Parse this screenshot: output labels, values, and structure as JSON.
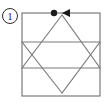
{
  "figure": {
    "label": "1",
    "label_style": "circled-number",
    "colors": {
      "frame_stroke": "#6e6e6e",
      "star_stroke": "#7a7a7a",
      "marker_fill": "#1a1a1a",
      "arrow_fill": "#1a1a1a",
      "label_stroke": "#2b2b2b",
      "background": "#ffffff"
    },
    "label_circle": {
      "cx": 10,
      "cy": 16,
      "r": 7.5
    },
    "frame": {
      "x": 22,
      "y": 13,
      "width": 78,
      "height": 83
    },
    "up_triangle": {
      "apex": [
        62,
        15
      ],
      "left": [
        22,
        68
      ],
      "right": [
        100,
        68
      ]
    },
    "down_triangle": {
      "apex": [
        62,
        93
      ],
      "left": [
        22,
        42
      ],
      "right": [
        100,
        42
      ]
    },
    "marker_dot": {
      "cx": 54,
      "cy": 13,
      "r": 3.2
    },
    "arrow_head": {
      "tip": [
        62,
        13
      ],
      "back_top": [
        70,
        9
      ],
      "back_bottom": [
        70,
        17
      ],
      "direction": "left"
    }
  }
}
